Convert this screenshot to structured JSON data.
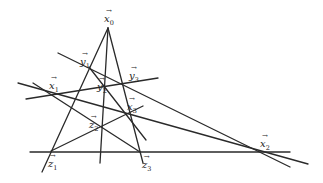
{
  "diagram": {
    "type": "geometric-construction",
    "points": [
      {
        "id": "x0",
        "name": "x",
        "index": "0"
      },
      {
        "id": "y1",
        "name": "y",
        "index": "1"
      },
      {
        "id": "y3",
        "name": "y",
        "index": "3"
      },
      {
        "id": "x1",
        "name": "x",
        "index": "1"
      },
      {
        "id": "y2",
        "name": "y",
        "index": "2"
      },
      {
        "id": "x3",
        "name": "x",
        "index": "3"
      },
      {
        "id": "z2",
        "name": "z",
        "index": "2"
      },
      {
        "id": "z1",
        "name": "z",
        "index": "1"
      },
      {
        "id": "z3",
        "name": "z",
        "index": "3"
      },
      {
        "id": "x2",
        "name": "x",
        "index": "2"
      }
    ],
    "vector_arrow": "→",
    "line_color": "#2a2a2a"
  }
}
